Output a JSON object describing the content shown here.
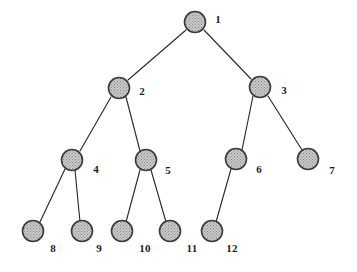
{
  "figure": {
    "kind": "tree-diagram",
    "background_color": "#ffffff",
    "node_fill_color": "#b3b3b3",
    "node_stroke_color": "#3a3a3a",
    "edge_color": "#2b2b2b",
    "label_color": "#1c1c1c",
    "node_radius": 10.5,
    "width": 357,
    "height": 272
  },
  "nodes": [
    {
      "id": "1",
      "label": "1",
      "cx": 195,
      "cy": 22,
      "r": 10.5,
      "label_x": 218,
      "label_y": 19,
      "level": 1
    },
    {
      "id": "2",
      "label": "2",
      "cx": 119,
      "cy": 88,
      "r": 10.5,
      "label_x": 142,
      "label_y": 91,
      "level": 2
    },
    {
      "id": "3",
      "label": "3",
      "cx": 260,
      "cy": 87,
      "r": 10.5,
      "label_x": 284,
      "label_y": 90,
      "level": 2
    },
    {
      "id": "4",
      "label": "4",
      "cx": 72,
      "cy": 160,
      "r": 10.5,
      "label_x": 96,
      "label_y": 169,
      "level": 3
    },
    {
      "id": "5",
      "label": "5",
      "cx": 146,
      "cy": 160,
      "r": 10.5,
      "label_x": 168,
      "label_y": 170,
      "level": 3
    },
    {
      "id": "6",
      "label": "6",
      "cx": 236,
      "cy": 159,
      "r": 10.5,
      "label_x": 259,
      "label_y": 169,
      "level": 3
    },
    {
      "id": "7",
      "label": "7",
      "cx": 308,
      "cy": 159,
      "r": 10.5,
      "label_x": 332,
      "label_y": 170,
      "level": 3
    },
    {
      "id": "8",
      "label": "8",
      "cx": 33,
      "cy": 231,
      "r": 10.5,
      "label_x": 53,
      "label_y": 248,
      "level": 4
    },
    {
      "id": "9",
      "label": "9",
      "cx": 82,
      "cy": 231,
      "r": 10.5,
      "label_x": 99,
      "label_y": 248,
      "level": 4
    },
    {
      "id": "10",
      "label": "10",
      "cx": 122,
      "cy": 231,
      "r": 10.5,
      "label_x": 145,
      "label_y": 248,
      "level": 4
    },
    {
      "id": "11",
      "label": "11",
      "cx": 170,
      "cy": 231,
      "r": 10.5,
      "label_x": 192,
      "label_y": 248,
      "level": 4
    },
    {
      "id": "12",
      "label": "12",
      "cx": 212,
      "cy": 231,
      "r": 10.5,
      "label_x": 232,
      "label_y": 248,
      "level": 4
    }
  ],
  "edges": [
    {
      "from": "1",
      "to": "2",
      "x1": 186,
      "y1": 30,
      "x2": 128,
      "y2": 80
    },
    {
      "from": "1",
      "to": "3",
      "x1": 204,
      "y1": 30,
      "x2": 251,
      "y2": 79
    },
    {
      "from": "2",
      "to": "4",
      "x1": 111,
      "y1": 97,
      "x2": 80,
      "y2": 151
    },
    {
      "from": "2",
      "to": "5",
      "x1": 126,
      "y1": 97,
      "x2": 140,
      "y2": 151
    },
    {
      "from": "3",
      "to": "6",
      "x1": 253,
      "y1": 96,
      "x2": 242,
      "y2": 150
    },
    {
      "from": "3",
      "to": "7",
      "x1": 268,
      "y1": 96,
      "x2": 302,
      "y2": 150
    },
    {
      "from": "4",
      "to": "8",
      "x1": 65,
      "y1": 169,
      "x2": 40,
      "y2": 222
    },
    {
      "from": "4",
      "to": "9",
      "x1": 75,
      "y1": 170,
      "x2": 80,
      "y2": 222
    },
    {
      "from": "5",
      "to": "10",
      "x1": 140,
      "y1": 170,
      "x2": 126,
      "y2": 222
    },
    {
      "from": "5",
      "to": "11",
      "x1": 151,
      "y1": 170,
      "x2": 166,
      "y2": 222
    },
    {
      "from": "6",
      "to": "12",
      "x1": 231,
      "y1": 169,
      "x2": 216,
      "y2": 222
    }
  ]
}
